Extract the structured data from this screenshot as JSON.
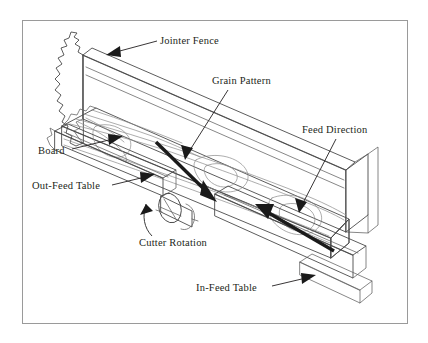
{
  "figure": {
    "background_color": "#ffffff",
    "frame_color": "#9a9a9a",
    "line_color": "#5f5f5f",
    "arrow_color": "#1a1a1a",
    "text_color": "#231f20"
  },
  "labels": {
    "jointer_fence": "Jointer Fence",
    "grain_pattern": "Grain Pattern",
    "feed_direction": "Feed Direction",
    "board": "Board",
    "out_feed_table": "Out-Feed Table",
    "cutter_rotation": "Cutter Rotation",
    "in_feed_table": "In-Feed Table"
  },
  "annotations": [
    {
      "id": "jointer-fence",
      "label": "Jointer Fence",
      "text_x": 160,
      "text_y": 44,
      "anchor": "start",
      "leader": "M157,41 L116,52",
      "arrow_tip": {
        "x": 108,
        "y": 54
      },
      "arrow_angle": 195
    },
    {
      "id": "grain-pattern",
      "label": "Grain Pattern",
      "text_x": 212,
      "text_y": 84,
      "anchor": "start",
      "leader": "M228,90 L190,150",
      "arrow_tip": {
        "x": 186,
        "y": 158
      },
      "arrow_angle": 122
    },
    {
      "id": "feed-direction",
      "label": "Feed Direction",
      "text_x": 302,
      "text_y": 133,
      "anchor": "start",
      "leader": "M336,139 L303,203",
      "arrow_tip": {
        "x": 300,
        "y": 211
      },
      "arrow_angle": 117
    },
    {
      "id": "board",
      "label": "Board",
      "text_x": 38,
      "text_y": 154,
      "anchor": "start",
      "leader": "M72,149 L113,139",
      "arrow_tip": {
        "x": 122,
        "y": 136
      },
      "arrow_angle": -14
    },
    {
      "id": "out-feed-table",
      "label": "Out-Feed Table",
      "text_x": 32,
      "text_y": 189,
      "anchor": "start",
      "leader": "M112,185 L145,177",
      "arrow_tip": {
        "x": 154,
        "y": 175
      },
      "arrow_angle": -14
    },
    {
      "id": "cutter-rotation",
      "label": "Cutter Rotation",
      "text_x": 139,
      "text_y": 246,
      "anchor": "start",
      "leader": "",
      "arrow_tip": {
        "x": 141,
        "y": 198
      },
      "arrow_angle": -55
    },
    {
      "id": "in-feed-table",
      "label": "In-Feed Table",
      "text_x": 196,
      "text_y": 291,
      "anchor": "start",
      "leader": "M272,286 L306,278",
      "arrow_tip": {
        "x": 315,
        "y": 276
      },
      "arrow_angle": -14
    }
  ],
  "bold_arrows": [
    {
      "id": "grain-direction-arrow",
      "label": "Grain Pattern direction",
      "from": {
        "x": 156,
        "y": 142
      },
      "to": {
        "x": 216,
        "y": 201
      },
      "head_at": "to"
    },
    {
      "id": "feed-direction-arrow",
      "label": "Feed Direction of travel",
      "from": {
        "x": 334,
        "y": 251
      },
      "to": {
        "x": 256,
        "y": 205
      },
      "head_at": "to"
    }
  ],
  "parts": [
    {
      "id": "jointer-fence",
      "name": "Jointer Fence",
      "description": "Tall angled guide slab running the length of the machine with a torn cutaway at its left end"
    },
    {
      "id": "board",
      "name": "Board",
      "description": "Workpiece with flowing wood grain contours, hatched end-grain cross-section at the right"
    },
    {
      "id": "out-feed-table",
      "name": "Out-Feed Table",
      "description": "Left-hand table surface past the cutterhead"
    },
    {
      "id": "in-feed-table",
      "name": "In-Feed Table",
      "description": "Right-hand table surface where the board enters"
    },
    {
      "id": "cutterhead",
      "name": "Cutterhead",
      "description": "Cylindrical rotating cutter between the two tables"
    }
  ]
}
